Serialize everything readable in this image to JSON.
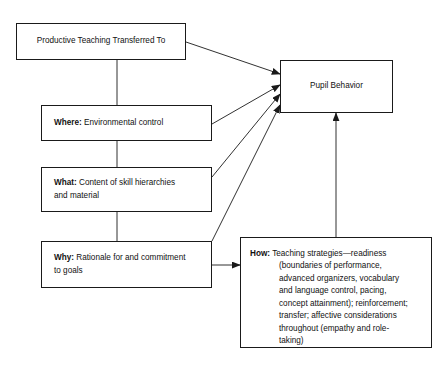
{
  "diagram": {
    "title": "Productive Teaching Transferred To Pupil Behavior",
    "canvas": {
      "width": 443,
      "height": 367,
      "background": "#ffffff"
    },
    "stroke_color": "#1a1a1a",
    "text_color": "#111111",
    "nodes": {
      "productive": {
        "text": "Productive Teaching Transferred To"
      },
      "pupil": {
        "text": "Pupil Behavior"
      },
      "where": {
        "key": "Where:",
        "body": " Environmental control"
      },
      "what": {
        "key": "What:",
        "body": " Content of skill hierarchies\nand material"
      },
      "why": {
        "key": "Why:",
        "body": " Rationale for and commitment\nto goals"
      },
      "how": {
        "key": "How:",
        "line1": " Teaching strategies—readiness",
        "line2": "(boundaries of performance,",
        "line3": "advanced organizers, vocabulary",
        "line4": "and language control, pacing,",
        "line5": "concept attainment); reinforcement;",
        "line6": "transfer; affective considerations",
        "line7": "throughout (empathy and role-",
        "line8": "taking)"
      }
    },
    "edges": [
      {
        "name": "productive-to-pupil",
        "type": "arrow"
      },
      {
        "name": "productive-to-where",
        "type": "line"
      },
      {
        "name": "where-to-pupil",
        "type": "arrow"
      },
      {
        "name": "where-to-what",
        "type": "line"
      },
      {
        "name": "what-to-pupil",
        "type": "arrow"
      },
      {
        "name": "what-to-why",
        "type": "line"
      },
      {
        "name": "why-to-pupil",
        "type": "arrow"
      },
      {
        "name": "why-to-how",
        "type": "arrow"
      },
      {
        "name": "how-to-pupil",
        "type": "arrow"
      }
    ]
  }
}
